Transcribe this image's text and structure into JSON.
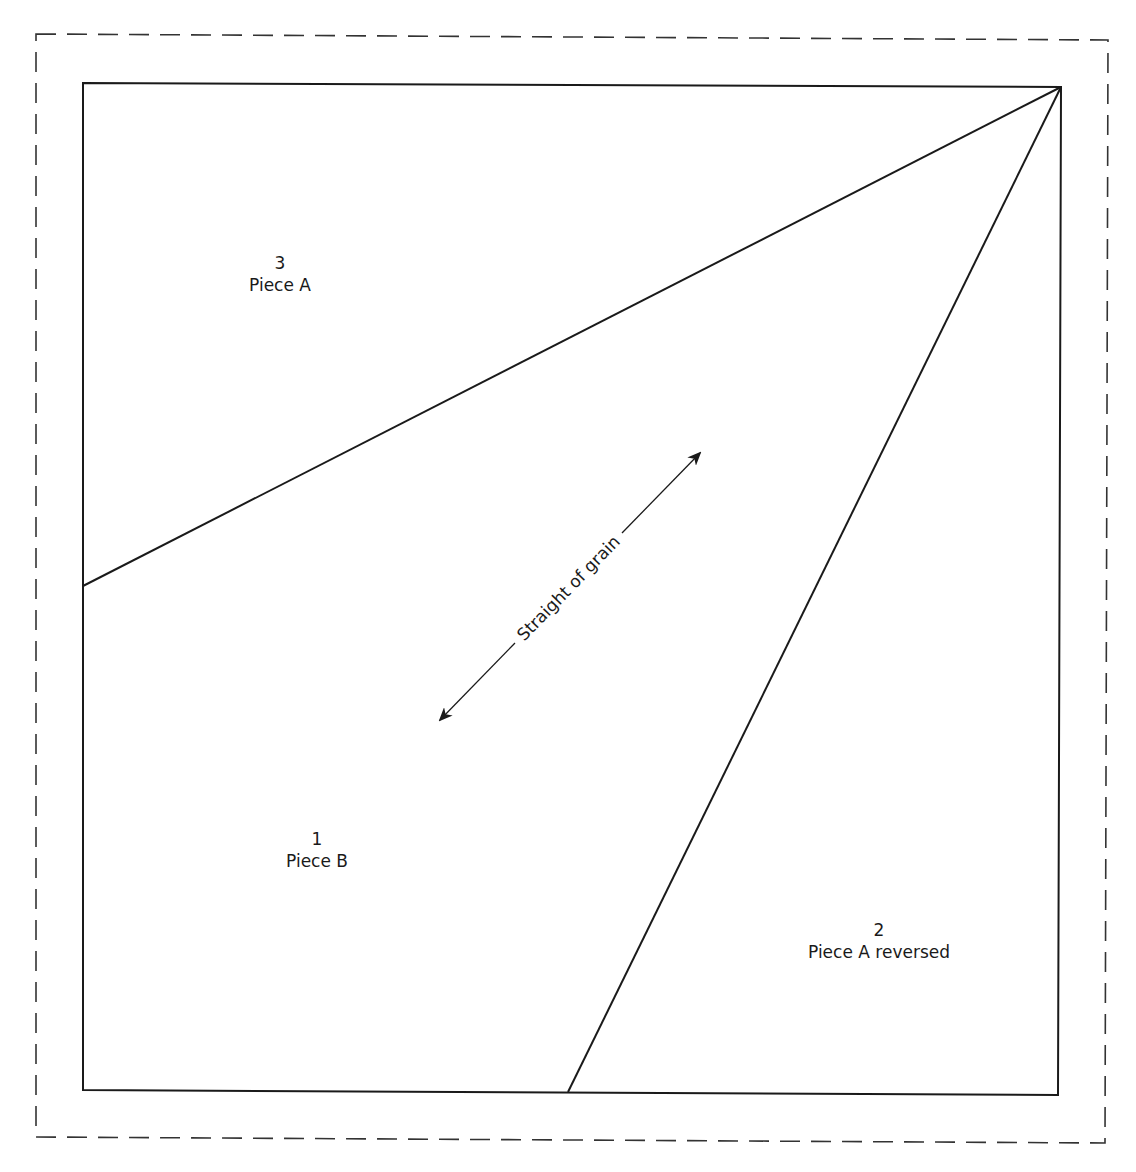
{
  "diagram": {
    "colors": {
      "line": "#1a1a1a",
      "background": "#ffffff",
      "seam_allowance": "#333333"
    },
    "seam_allowance": {
      "style": "dashed",
      "corners": [
        [
          36,
          34
        ],
        [
          1108,
          40
        ],
        [
          1105,
          1143
        ],
        [
          36,
          1137
        ]
      ]
    },
    "block_outline": {
      "style": "solid",
      "corners": [
        [
          83,
          83
        ],
        [
          1061,
          87
        ],
        [
          1058,
          1095
        ],
        [
          83,
          1090
        ]
      ]
    },
    "seam_lines": [
      {
        "from": [
          1061,
          87
        ],
        "to": [
          83,
          586
        ]
      },
      {
        "from": [
          1061,
          87
        ],
        "to": [
          568,
          1092
        ]
      }
    ],
    "pieces": [
      {
        "number": "3",
        "name": "Piece A",
        "x": 280,
        "y": 252
      },
      {
        "number": "1",
        "name": "Piece B",
        "x": 317,
        "y": 828
      },
      {
        "number": "2",
        "name": "Piece A reversed",
        "x": 879,
        "y": 919
      }
    ],
    "grain": {
      "label": "Straight of grain",
      "from": [
        440,
        720
      ],
      "to": [
        700,
        453
      ],
      "label_center": [
        566,
        588
      ],
      "angle": -45.7
    }
  }
}
